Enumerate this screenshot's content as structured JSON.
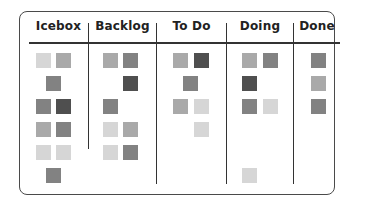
{
  "board": {
    "columns": [
      {
        "title": "Icebox",
        "cards": [
          {
            "row": 0,
            "slot": "left",
            "shade": "light"
          },
          {
            "row": 0,
            "slot": "right",
            "shade": "mid"
          },
          {
            "row": 1,
            "slot": "center",
            "shade": "middark"
          },
          {
            "row": 2,
            "slot": "left",
            "shade": "middark"
          },
          {
            "row": 2,
            "slot": "right",
            "shade": "dark"
          },
          {
            "row": 3,
            "slot": "left",
            "shade": "mid"
          },
          {
            "row": 3,
            "slot": "right",
            "shade": "middark"
          },
          {
            "row": 4,
            "slot": "left",
            "shade": "light"
          },
          {
            "row": 4,
            "slot": "right",
            "shade": "light"
          },
          {
            "row": 5,
            "slot": "center",
            "shade": "middark"
          }
        ]
      },
      {
        "title": "Backlog",
        "cards": [
          {
            "row": 0,
            "slot": "left",
            "shade": "mid"
          },
          {
            "row": 0,
            "slot": "right",
            "shade": "middark"
          },
          {
            "row": 1,
            "slot": "right",
            "shade": "dark"
          },
          {
            "row": 2,
            "slot": "left",
            "shade": "middark"
          },
          {
            "row": 3,
            "slot": "left",
            "shade": "light"
          },
          {
            "row": 3,
            "slot": "right",
            "shade": "mid"
          },
          {
            "row": 4,
            "slot": "left",
            "shade": "light"
          },
          {
            "row": 4,
            "slot": "right",
            "shade": "middark"
          }
        ]
      },
      {
        "title": "To Do",
        "cards": [
          {
            "row": 0,
            "slot": "left",
            "shade": "mid"
          },
          {
            "row": 0,
            "slot": "right",
            "shade": "dark"
          },
          {
            "row": 1,
            "slot": "center",
            "shade": "middark"
          },
          {
            "row": 2,
            "slot": "left",
            "shade": "mid"
          },
          {
            "row": 2,
            "slot": "right",
            "shade": "light"
          },
          {
            "row": 3,
            "slot": "right",
            "shade": "light"
          }
        ]
      },
      {
        "title": "Doing",
        "cards": [
          {
            "row": 0,
            "slot": "left",
            "shade": "mid"
          },
          {
            "row": 0,
            "slot": "right",
            "shade": "middark"
          },
          {
            "row": 1,
            "slot": "left",
            "shade": "dark"
          },
          {
            "row": 2,
            "slot": "left",
            "shade": "middark"
          },
          {
            "row": 2,
            "slot": "right",
            "shade": "light"
          },
          {
            "row": 5,
            "slot": "left",
            "shade": "light"
          }
        ]
      },
      {
        "title": "Done",
        "cards": [
          {
            "row": 0,
            "slot": "center",
            "shade": "middark"
          },
          {
            "row": 1,
            "slot": "center",
            "shade": "mid"
          },
          {
            "row": 2,
            "slot": "center",
            "shade": "middark"
          }
        ]
      }
    ],
    "shades": {
      "light": "#d6d6d6",
      "mid": "#a9a9a9",
      "middark": "#828282",
      "dark": "#4f4f4f"
    },
    "border_color": "#4a4a4a"
  }
}
